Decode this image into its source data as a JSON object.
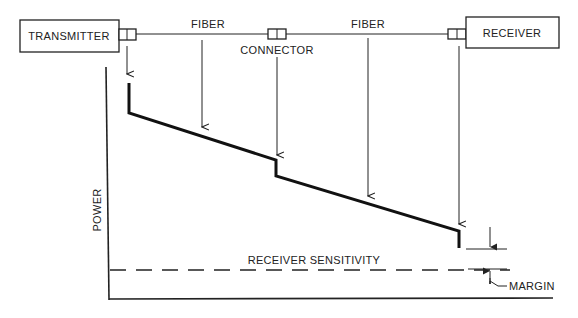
{
  "diagram": {
    "components": {
      "transmitter": "TRANSMITTER",
      "receiver": "RECEIVER",
      "fiber_1": "FIBER",
      "fiber_2": "FIBER",
      "connector": "CONNECTOR"
    },
    "graph": {
      "y_axis_label": "POWER",
      "threshold_label": "RECEIVER SENSITIVITY",
      "margin_label": "MARGIN"
    },
    "colors": {
      "line": "#111111",
      "background": "#ffffff"
    }
  }
}
